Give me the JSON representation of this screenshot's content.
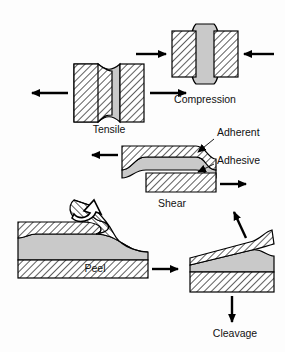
{
  "figure": {
    "background_color": "#fdfdfd",
    "adherent_fill": "#ffffff",
    "adherent_hatch_color": "#1a1a1a",
    "adhesive_fill": "#c9c9c9",
    "outline_color": "#000000",
    "arrow_color": "#000000",
    "text_color": "#111111"
  },
  "captions": {
    "tensile": "Tensile",
    "compression": "Compression",
    "shear": "Shear",
    "peel": "Peel",
    "cleavage": "Cleavage"
  },
  "annotations": {
    "adherent": "Adherent",
    "adhesive": "Adhesive"
  },
  "diagrams": [
    {
      "name": "tensile",
      "caption": "Tensile",
      "arrow_directions": [
        "left",
        "right"
      ],
      "arrow_count": 2,
      "adhesive_shape": "hourglass-concave",
      "orientation": "vertical-blocks"
    },
    {
      "name": "compression",
      "caption": "Compression",
      "arrow_directions": [
        "right-inward",
        "left-inward"
      ],
      "arrow_count": 2,
      "adhesive_shape": "barrel-convex",
      "orientation": "vertical-blocks"
    },
    {
      "name": "shear",
      "caption": "Shear",
      "arrow_directions": [
        "left",
        "right"
      ],
      "arrow_count": 2,
      "adhesive_shape": "sheared-parallelogram",
      "orientation": "horizontal-offset-blocks",
      "labels": [
        "Adherent",
        "Adhesive"
      ]
    },
    {
      "name": "peel",
      "caption": "Peel",
      "arrow_directions": [
        "curved-up-left",
        "right"
      ],
      "arrow_count": 2,
      "adhesive_shape": "stretched-taper",
      "orientation": "horizontal-peeling"
    },
    {
      "name": "cleavage",
      "caption": "Cleavage",
      "arrow_directions": [
        "up-right-diagonal",
        "down"
      ],
      "arrow_count": 2,
      "adhesive_shape": "wedge-taper",
      "orientation": "tilted-top-block"
    }
  ]
}
